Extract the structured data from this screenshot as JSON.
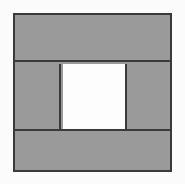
{
  "figure": {
    "title": "Shaded square frame with unshaded center",
    "canvas": {
      "width": 185,
      "height": 184,
      "background_color": "#fbfbfb"
    },
    "outer_square": {
      "label": "outer square",
      "x": 13,
      "y": 13,
      "width": 159,
      "height": 159,
      "border_color": "#3a3a3a",
      "border_width": 2
    },
    "colors": {
      "shaded_fill": "#9a9a9a",
      "unshaded_fill": "#fdfdfd",
      "line": "#3a3a3a",
      "background": "#fbfbfb"
    },
    "regions": [
      {
        "name": "top band",
        "shading": "shaded",
        "fill": "#9a9a9a",
        "x": 13,
        "y": 13,
        "width": 159,
        "height": 49
      },
      {
        "name": "left side column",
        "shading": "shaded",
        "fill": "#9a9a9a",
        "x": 13,
        "y": 62,
        "width": 46,
        "height": 67
      },
      {
        "name": "center square",
        "shading": "unshaded",
        "fill": "#fdfdfd",
        "x": 61,
        "y": 62,
        "width": 62,
        "height": 67
      },
      {
        "name": "right side column",
        "shading": "shaded",
        "fill": "#9a9a9a",
        "x": 125,
        "y": 62,
        "width": 47,
        "height": 67
      },
      {
        "name": "bottom band",
        "shading": "shaded",
        "fill": "#9a9a9a",
        "x": 13,
        "y": 129,
        "width": 159,
        "height": 43
      }
    ],
    "dividers": [
      {
        "name": "upper horizontal divider",
        "orientation": "horizontal",
        "position": 62
      },
      {
        "name": "lower horizontal divider",
        "orientation": "horizontal",
        "position": 129
      },
      {
        "name": "left vertical divider",
        "orientation": "vertical",
        "position": 59
      },
      {
        "name": "right vertical divider",
        "orientation": "vertical",
        "position": 123
      }
    ]
  }
}
